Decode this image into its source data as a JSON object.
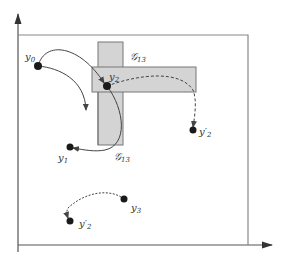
{
  "diagram": {
    "colors": {
      "axis": "#555555",
      "frame": "#888888",
      "region_fill": "#d4d4d4",
      "region_stroke": "#777777",
      "curve": "#444444",
      "point": "#1a1a1a"
    },
    "regions": [
      {
        "name": "G13-vertical",
        "label": "G",
        "sub": "13"
      },
      {
        "name": "G13-horizontal",
        "label": "G",
        "sub": "13"
      }
    ],
    "points": [
      {
        "id": "y0",
        "label": "y",
        "sub": "0"
      },
      {
        "id": "y1",
        "label": "y",
        "sub": "1"
      },
      {
        "id": "y2",
        "label": "y",
        "sub": "2"
      },
      {
        "id": "y2prime-right",
        "label": "y′",
        "sub": "2"
      },
      {
        "id": "y3",
        "label": "y",
        "sub": "3"
      },
      {
        "id": "y2prime-bottom",
        "label": "y′",
        "sub": "2"
      }
    ],
    "labels": {
      "g13_top": {
        "main": "𝒢",
        "sub": "13"
      },
      "g13_bottom": {
        "main": "𝒢",
        "sub": "13"
      }
    },
    "trajectories": [
      {
        "from": "y0",
        "to": "y2",
        "style": "solid"
      },
      {
        "from": "y0",
        "to": "open-end",
        "style": "solid"
      },
      {
        "from": "y2",
        "to": "y1",
        "style": "solid"
      },
      {
        "from": "y2",
        "to": "y2prime-right",
        "style": "dashed"
      },
      {
        "from": "y3",
        "to": "y2prime-bottom",
        "style": "dashed"
      }
    ]
  }
}
